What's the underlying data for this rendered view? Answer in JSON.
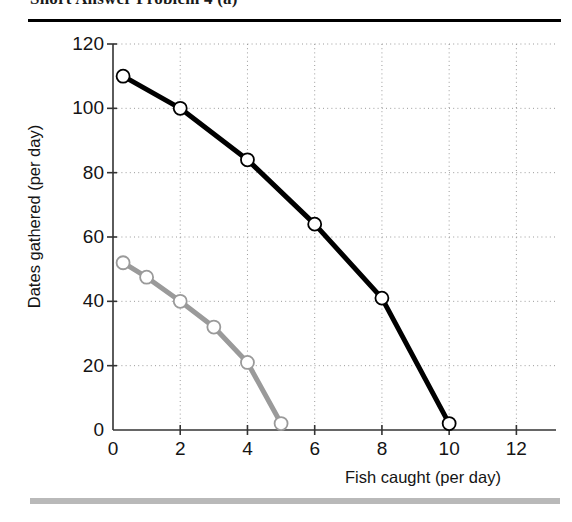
{
  "page": {
    "title": "Short Answer Problem 4 (a)"
  },
  "chart_data": {
    "type": "line",
    "title": "",
    "xlabel": "Fish caught (per day)",
    "ylabel": "Dates gathered (per day)",
    "xlim": [
      0,
      13
    ],
    "ylim": [
      0,
      120
    ],
    "xticks": [
      0,
      2,
      4,
      6,
      8,
      10,
      12
    ],
    "xtick_labels": [
      "0",
      "2",
      "4",
      "6",
      "8",
      "10",
      "12"
    ],
    "yticks": [
      0,
      20,
      40,
      60,
      80,
      100,
      120
    ],
    "ytick_labels": [
      "0",
      "20",
      "40",
      "60",
      "80",
      "100",
      "120"
    ],
    "grid": "dotted-both",
    "legend": "none",
    "series": [
      {
        "name": "outer-ppf-black",
        "color": "#000000",
        "marker": "open-circle",
        "linewidth": 5,
        "x": [
          0.3,
          2,
          4,
          6,
          8,
          10
        ],
        "y": [
          110,
          100,
          84,
          64,
          41,
          2
        ]
      },
      {
        "name": "inner-ppf-gray",
        "color": "#9a9a9a",
        "marker": "open-circle",
        "linewidth": 5,
        "x": [
          0.3,
          1,
          2,
          3,
          4,
          5
        ],
        "y": [
          52,
          47.5,
          40,
          32,
          21,
          2
        ]
      }
    ]
  }
}
